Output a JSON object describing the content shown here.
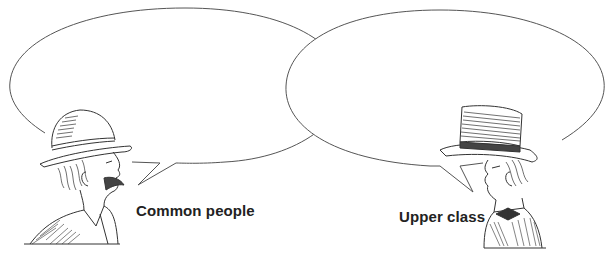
{
  "figure": {
    "type": "speech-bubble-comparison",
    "background": "#ffffff",
    "line_color": "#555555"
  },
  "speakers": [
    {
      "id": "common",
      "label": "Common people",
      "hat": "bowler-hat",
      "features": [
        "mustache",
        "jacket"
      ],
      "bubble": {
        "text": "",
        "position": "left",
        "tail_direction": "toward-speaker-mouth"
      }
    },
    {
      "id": "upper",
      "label": "Upper class",
      "hat": "top-hat",
      "features": [
        "bow-tie",
        "striped-coat"
      ],
      "bubble": {
        "text": "",
        "position": "right",
        "tail_direction": "toward-speaker-mouth"
      }
    }
  ]
}
